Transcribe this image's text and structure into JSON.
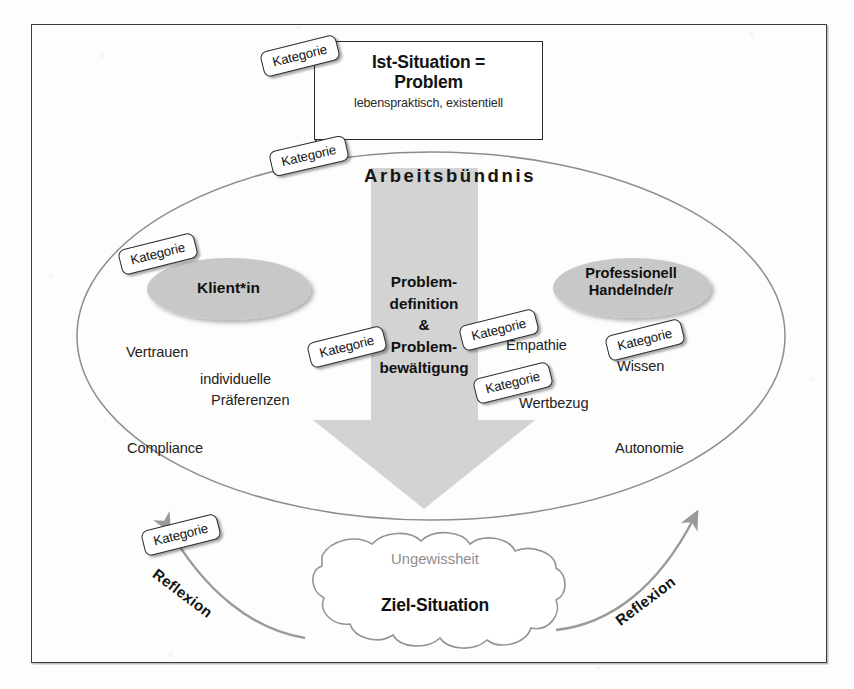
{
  "diagram": {
    "title": "Arbeitsbündnis",
    "problem_box": {
      "line1": "Ist-Situation =",
      "line2": "Problem",
      "subtitle": "lebenspraktisch, existentiell"
    },
    "center_heading": "Arbeitsbündnis",
    "actors": {
      "client": "Klient*in",
      "professional_line1": "Professionell",
      "professional_line2": "Handelnde/r"
    },
    "arrow": {
      "line1": "Problem-",
      "line2": "definition",
      "line3": "&",
      "line4": "Problem-",
      "line5": "bewältigung"
    },
    "client_attributes": [
      {
        "text": "Vertrauen"
      },
      {
        "text": "individuelle"
      },
      {
        "text": "Präferenzen"
      },
      {
        "text": "Compliance"
      }
    ],
    "professional_attributes": [
      {
        "text": "Empathie"
      },
      {
        "text": "Wissen"
      },
      {
        "text": "Wertbezug"
      },
      {
        "text": "Autonomie"
      }
    ],
    "goal": {
      "uncertainty": "Ungewissheit",
      "label": "Ziel-Situation"
    },
    "reflection": {
      "left": "Reflexion",
      "right": "Reflexion"
    },
    "category_tags": [
      {
        "id": "k1",
        "label": "Kategorie"
      },
      {
        "id": "k2",
        "label": "Kategorie"
      },
      {
        "id": "k3",
        "label": "Kategorie"
      },
      {
        "id": "k4",
        "label": "Kategorie"
      },
      {
        "id": "k5",
        "label": "Kategorie"
      },
      {
        "id": "k6",
        "label": "Kategorie"
      },
      {
        "id": "k7",
        "label": "Kategorie"
      },
      {
        "id": "k8",
        "label": "Kategorie"
      }
    ],
    "colors": {
      "frame_stroke": "#3b3b3b",
      "box_stroke": "#2b2b2b",
      "ellipse_stroke": "#8d8d8d",
      "actor_fill": "#c9c9c9",
      "arrow_fill": "#d2d2d2",
      "cloud_stroke": "#909090",
      "reflection_arc": "#9a9a9a",
      "muted_text": "#8e8e8e",
      "tag_bg": "#ffffff"
    }
  }
}
